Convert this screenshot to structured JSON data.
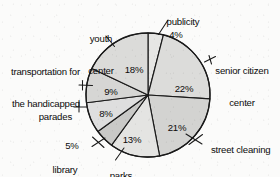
{
  "chart_data": {
    "type": "pie",
    "title": "",
    "subtitle": "",
    "xlabel": "",
    "ylabel": "",
    "legend_position": "none",
    "grid": false,
    "value_unit": "%",
    "total": 100,
    "start_angle_deg": 0,
    "direction": "clockwise",
    "categories": [
      "publicity",
      "senior citizen center",
      "street cleaning",
      "parks",
      "library aides",
      "parades",
      "transportation for the handicapped",
      "youth center"
    ],
    "values": [
      4,
      22,
      21,
      13,
      5,
      8,
      9,
      18
    ],
    "slices": [
      {
        "label": "publicity",
        "label_lines": [
          "publicity"
        ],
        "value": 4,
        "display_value": "4%",
        "fill": "#e6e6e4",
        "label_placement": "outside-top",
        "has_leader_line": true
      },
      {
        "label": "senior citizen center",
        "label_lines": [
          "senior citizen",
          "center"
        ],
        "value": 22,
        "display_value": "22%",
        "fill": "#dcdcda",
        "label_placement": "outside-right",
        "has_leader_line": true
      },
      {
        "label": "street cleaning",
        "label_lines": [
          "street cleaning"
        ],
        "value": 21,
        "display_value": "21%",
        "fill": "#d3d3d1",
        "label_placement": "outside-right",
        "has_leader_line": true
      },
      {
        "label": "parks",
        "label_lines": [
          "parks"
        ],
        "value": 13,
        "display_value": "13%",
        "fill": "#e4e4e2",
        "label_placement": "outside-bottom",
        "has_leader_line": true
      },
      {
        "label": "library aides",
        "label_lines": [
          "library",
          "aides"
        ],
        "value": 5,
        "display_value": "5%",
        "fill": "#c9c9c7",
        "label_placement": "outside-bottom-left",
        "has_leader_line": true
      },
      {
        "label": "parades",
        "label_lines": [
          "parades"
        ],
        "value": 8,
        "display_value": "8%",
        "fill": "#dedede",
        "label_placement": "outside-left",
        "has_leader_line": true
      },
      {
        "label": "transportation for the handicapped",
        "label_lines": [
          "transportation for",
          "the handicapped"
        ],
        "value": 9,
        "display_value": "9%",
        "fill": "#d6d6d4",
        "label_placement": "outside-left",
        "has_leader_line": true
      },
      {
        "label": "youth center",
        "label_lines": [
          "youth",
          "center"
        ],
        "value": 18,
        "display_value": "18%",
        "fill": "#dbdbd9",
        "label_placement": "outside-top-left",
        "has_leader_line": true
      }
    ],
    "geometry": {
      "center_x": 148,
      "center_y": 95,
      "radius": 62
    },
    "colors": {
      "background": "#fbfbfa",
      "outline": "#1a1a1a",
      "text": "#0b0b0b"
    }
  },
  "labels": {
    "publicity": "publicity",
    "publicity_pct": "4%",
    "senior_l1": "senior citizen",
    "senior_l2": "center",
    "senior_pct": "22%",
    "street_cleaning": "street cleaning",
    "street_cleaning_pct": "21%",
    "parks": "parks",
    "parks_pct": "13%",
    "library_pct": "5%",
    "library_l1": "library",
    "library_l2": "aides",
    "parades": "parades",
    "parades_pct": "8%",
    "transport_l1": "transportation for",
    "transport_l2": "the handicapped",
    "transport_pct": "9%",
    "youth_l1": "youth",
    "youth_l2": "center",
    "youth_pct": "18%"
  }
}
